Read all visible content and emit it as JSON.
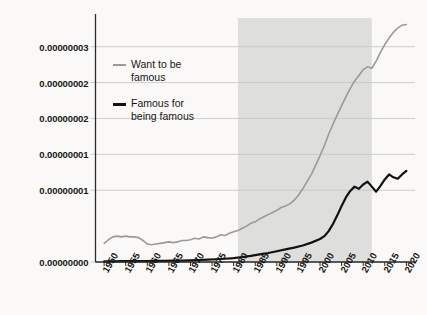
{
  "chart_data": {
    "type": "line",
    "title": "",
    "xlabel": "",
    "ylabel": "",
    "xlim": [
      1948,
      2022
    ],
    "ylim": [
      0,
      3.4e-08
    ],
    "grid": true,
    "legend_position": "upper-left-inside",
    "x_tick_labels": [
      "1950",
      "1955",
      "1960",
      "1965",
      "1970",
      "1975",
      "1980",
      "1985",
      "1990",
      "1995",
      "2000",
      "2005",
      "2010",
      "2015",
      "2020"
    ],
    "x_ticks": [
      1950,
      1955,
      1960,
      1965,
      1970,
      1975,
      1980,
      1985,
      1990,
      1995,
      2000,
      2005,
      2010,
      2015,
      2020
    ],
    "y_tick_labels": [
      "0.00000003",
      "0.00000002",
      "0.00000002",
      "0.00000001",
      "0.00000001",
      "0.00000000"
    ],
    "y_ticks": [
      3e-08,
      2.5e-08,
      2e-08,
      1.5e-08,
      1e-08,
      0.0
    ],
    "shaded_region": {
      "x_start": 1981,
      "x_end": 2012,
      "color": "#d2d2d2"
    },
    "series": [
      {
        "name": "Want to be famous",
        "color": "#9a9a9a",
        "width": 1.6,
        "x": [
          1950,
          1951,
          1952,
          1953,
          1954,
          1955,
          1956,
          1957,
          1958,
          1959,
          1960,
          1961,
          1962,
          1963,
          1964,
          1965,
          1966,
          1967,
          1968,
          1969,
          1970,
          1971,
          1972,
          1973,
          1974,
          1975,
          1976,
          1977,
          1978,
          1979,
          1980,
          1981,
          1982,
          1983,
          1984,
          1985,
          1986,
          1987,
          1988,
          1989,
          1990,
          1991,
          1992,
          1993,
          1994,
          1995,
          1996,
          1997,
          1998,
          1999,
          2000,
          2001,
          2002,
          2003,
          2004,
          2005,
          2006,
          2007,
          2008,
          2009,
          2010,
          2011,
          2012,
          2013,
          2014,
          2015,
          2016,
          2017,
          2018,
          2019,
          2020
        ],
        "y": [
          2.6e-09,
          3.1e-09,
          3.5e-09,
          3.6e-09,
          3.5e-09,
          3.6e-09,
          3.5e-09,
          3.5e-09,
          3.4e-09,
          3e-09,
          2.5e-09,
          2.4e-09,
          2.5e-09,
          2.6e-09,
          2.7e-09,
          2.8e-09,
          2.7e-09,
          2.8e-09,
          3e-09,
          3e-09,
          3.1e-09,
          3.3e-09,
          3.2e-09,
          3.5e-09,
          3.4e-09,
          3.3e-09,
          3.5e-09,
          3.8e-09,
          3.7e-09,
          4e-09,
          4.2e-09,
          4.4e-09,
          4.7e-09,
          5e-09,
          5.4e-09,
          5.6e-09,
          6e-09,
          6.3e-09,
          6.6e-09,
          6.9e-09,
          7.2e-09,
          7.6e-09,
          7.8e-09,
          8.1e-09,
          8.6e-09,
          9.3e-09,
          1.02e-08,
          1.12e-08,
          1.22e-08,
          1.35e-08,
          1.48e-08,
          1.62e-08,
          1.78e-08,
          1.92e-08,
          2.05e-08,
          2.18e-08,
          2.3e-08,
          2.42e-08,
          2.52e-08,
          2.6e-08,
          2.68e-08,
          2.72e-08,
          2.7e-08,
          2.8e-08,
          2.92e-08,
          3.03e-08,
          3.12e-08,
          3.2e-08,
          3.26e-08,
          3.3e-08,
          3.31e-08
        ]
      },
      {
        "name": "Famous for being famous",
        "color": "#111111",
        "width": 2.2,
        "x": [
          1950,
          1952,
          1954,
          1956,
          1958,
          1960,
          1962,
          1964,
          1966,
          1968,
          1970,
          1972,
          1974,
          1976,
          1978,
          1980,
          1982,
          1984,
          1986,
          1988,
          1990,
          1992,
          1994,
          1996,
          1998,
          2000,
          2001,
          2002,
          2003,
          2004,
          2005,
          2006,
          2007,
          2008,
          2009,
          2010,
          2011,
          2012,
          2013,
          2014,
          2015,
          2016,
          2017,
          2018,
          2019,
          2020
        ],
        "y": [
          1e-10,
          1e-10,
          1.1e-10,
          1.2e-10,
          1.2e-10,
          1.3e-10,
          1.5e-10,
          1.6e-10,
          1.8e-10,
          2e-10,
          2.4e-10,
          2.8e-10,
          3.2e-10,
          3.8e-10,
          4.5e-10,
          5.5e-10,
          7e-10,
          8.5e-10,
          1.05e-09,
          1.25e-09,
          1.5e-09,
          1.75e-09,
          2e-09,
          2.3e-09,
          2.7e-09,
          3.2e-09,
          3.6e-09,
          4.3e-09,
          5.3e-09,
          6.5e-09,
          7.8e-09,
          9e-09,
          9.9e-09,
          1.05e-08,
          1.02e-08,
          1.08e-08,
          1.12e-08,
          1.05e-08,
          9.8e-09,
          1.06e-08,
          1.15e-08,
          1.22e-08,
          1.18e-08,
          1.16e-08,
          1.22e-08,
          1.27e-08
        ]
      }
    ]
  },
  "legend": {
    "items": [
      {
        "label": "Want to be\nfamous",
        "color": "#9a9a9a",
        "weight": "thin"
      },
      {
        "label": "Famous for\nbeing famous",
        "color": "#111111",
        "weight": "thick"
      }
    ]
  },
  "axes": {
    "spine_color": "#2b2b2b",
    "grid_color": "#c8c8c8",
    "background": "#faf9f7"
  }
}
